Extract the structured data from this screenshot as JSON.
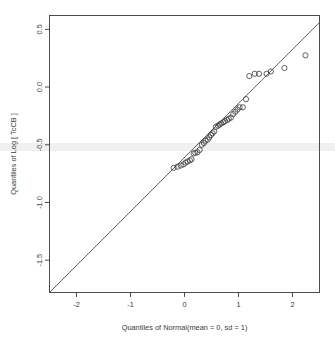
{
  "figure": {
    "background_color": "#ffffff",
    "foreground_color": "#3a3a3a",
    "artifact_band_color": "#f0f0f0"
  },
  "chart_data": {
    "type": "scatter",
    "title": "",
    "subtitle": "",
    "xlabel": "Quantiles of Normal(mean = 0, sd = 1)",
    "ylabel": "Quantiles of Log [ TcCB ]",
    "xlim": [
      -2.5,
      2.5
    ],
    "ylim": [
      -1.78,
      0.62
    ],
    "xticks": [
      -2,
      -1,
      0,
      1,
      2
    ],
    "xticklabels": [
      "-2",
      "-1",
      "0",
      "1",
      "2"
    ],
    "yticks": [
      0.5,
      0.0,
      -0.5,
      -1.0,
      -1.5
    ],
    "yticklabels": [
      "0.5",
      "0.0",
      "-0.5",
      "-1.0",
      "-1.5"
    ],
    "grid": false,
    "legend": null,
    "marker": "open-circle",
    "marker_size": 2.6,
    "reference_line": {
      "name": "qq-line",
      "type": "line",
      "x": [
        -2.5,
        2.5
      ],
      "y": [
        -1.78,
        0.56
      ],
      "color": "#3a3a3a",
      "width": 0.8
    },
    "points": [
      {
        "x": -0.2,
        "y": -0.7
      },
      {
        "x": -0.13,
        "y": -0.69
      },
      {
        "x": -0.07,
        "y": -0.68
      },
      {
        "x": -0.02,
        "y": -0.67
      },
      {
        "x": 0.02,
        "y": -0.655
      },
      {
        "x": 0.06,
        "y": -0.645
      },
      {
        "x": 0.1,
        "y": -0.635
      },
      {
        "x": 0.13,
        "y": -0.625
      },
      {
        "x": 0.17,
        "y": -0.575
      },
      {
        "x": 0.2,
        "y": -0.57
      },
      {
        "x": 0.24,
        "y": -0.565
      },
      {
        "x": 0.28,
        "y": -0.545
      },
      {
        "x": 0.32,
        "y": -0.5
      },
      {
        "x": 0.36,
        "y": -0.485
      },
      {
        "x": 0.39,
        "y": -0.465
      },
      {
        "x": 0.43,
        "y": -0.455
      },
      {
        "x": 0.46,
        "y": -0.435
      },
      {
        "x": 0.49,
        "y": -0.415
      },
      {
        "x": 0.52,
        "y": -0.4
      },
      {
        "x": 0.55,
        "y": -0.385
      },
      {
        "x": 0.58,
        "y": -0.345
      },
      {
        "x": 0.62,
        "y": -0.335
      },
      {
        "x": 0.65,
        "y": -0.325
      },
      {
        "x": 0.68,
        "y": -0.315
      },
      {
        "x": 0.72,
        "y": -0.305
      },
      {
        "x": 0.75,
        "y": -0.295
      },
      {
        "x": 0.79,
        "y": -0.285
      },
      {
        "x": 0.82,
        "y": -0.275
      },
      {
        "x": 0.86,
        "y": -0.265
      },
      {
        "x": 0.9,
        "y": -0.235
      },
      {
        "x": 0.94,
        "y": -0.215
      },
      {
        "x": 0.98,
        "y": -0.195
      },
      {
        "x": 1.02,
        "y": -0.175
      },
      {
        "x": 1.08,
        "y": -0.175
      },
      {
        "x": 1.14,
        "y": -0.105
      },
      {
        "x": 1.2,
        "y": 0.095
      },
      {
        "x": 1.3,
        "y": 0.115
      },
      {
        "x": 1.38,
        "y": 0.115
      },
      {
        "x": 1.52,
        "y": 0.115
      },
      {
        "x": 1.6,
        "y": 0.135
      },
      {
        "x": 1.85,
        "y": 0.165
      },
      {
        "x": 2.24,
        "y": 0.275
      }
    ]
  }
}
